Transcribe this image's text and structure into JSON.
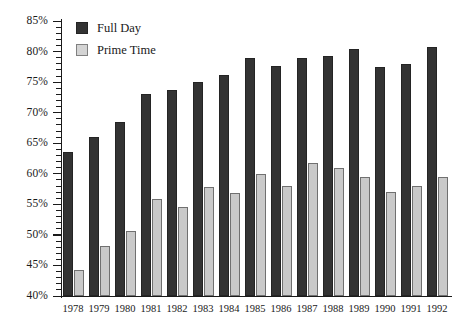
{
  "chart_data": {
    "type": "bar",
    "title": "",
    "xlabel": "",
    "ylabel": "",
    "ylim": [
      40,
      85
    ],
    "ytick_step": 5,
    "yminor_step": 1,
    "grid": false,
    "legend_position": "top-left",
    "categories": [
      "1978",
      "1979",
      "1980",
      "1981",
      "1982",
      "1983",
      "1984",
      "1985",
      "1986",
      "1987",
      "1988",
      "1989",
      "1990",
      "1991",
      "1992"
    ],
    "ytick_labels": [
      "40%",
      "45%",
      "50%",
      "55%",
      "60%",
      "65%",
      "70%",
      "75%",
      "80%",
      "85%"
    ],
    "series": [
      {
        "name": "Full Day",
        "color": "#333333",
        "values": [
          63.5,
          66.0,
          68.5,
          73.0,
          73.7,
          75.0,
          76.2,
          79.0,
          77.7,
          79.0,
          79.3,
          80.4,
          77.4,
          78.0,
          80.8
        ]
      },
      {
        "name": "Prime Time",
        "color": "#c9c9c9",
        "values": [
          44.2,
          48.2,
          50.7,
          55.8,
          54.6,
          57.8,
          56.9,
          60.0,
          58.0,
          61.7,
          60.9,
          59.5,
          57.0,
          58.0,
          59.5
        ]
      }
    ]
  },
  "legend": {
    "items": [
      {
        "label": "Full Day",
        "swatch": "full"
      },
      {
        "label": "Prime Time",
        "swatch": "prime"
      }
    ]
  }
}
